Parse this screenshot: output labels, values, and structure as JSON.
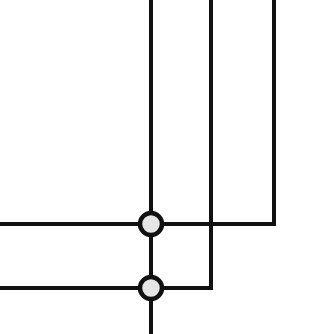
{
  "diagram": {
    "type": "wiring-schematic",
    "background": "#ffffff",
    "wire_color": "#111111",
    "wire_width": 4,
    "node_fill": "#e6e6e6",
    "node_stroke": "#111111",
    "node_radius": 11,
    "node_stroke_width": 4.5,
    "wires": [
      {
        "id": "wire-vertical-trunk",
        "points": [
          [
            151,
            0
          ],
          [
            151,
            334
          ]
        ]
      },
      {
        "id": "wire-middle-to-lower",
        "points": [
          [
            211,
            0
          ],
          [
            211,
            288
          ],
          [
            0,
            288
          ]
        ]
      },
      {
        "id": "wire-right-to-upper",
        "points": [
          [
            274,
            0
          ],
          [
            274,
            224
          ],
          [
            0,
            224
          ]
        ]
      }
    ],
    "nodes": [
      {
        "id": "junction-upper",
        "cx": 151,
        "cy": 224
      },
      {
        "id": "junction-lower",
        "cx": 151,
        "cy": 288
      }
    ]
  }
}
